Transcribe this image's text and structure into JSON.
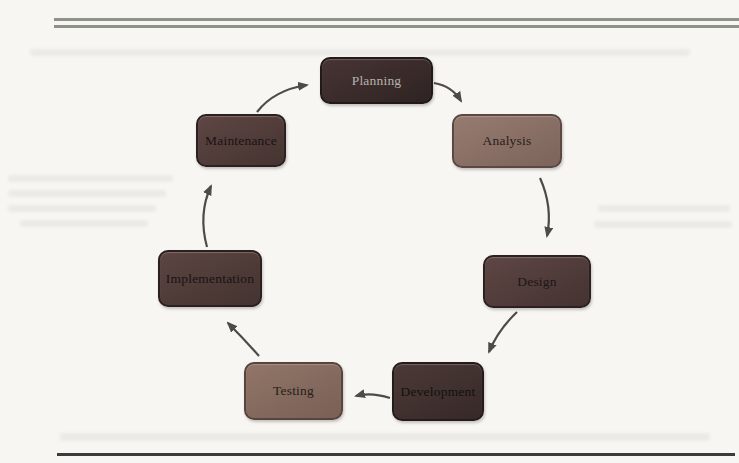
{
  "page": {
    "background_color": "#f7f6f3",
    "top_rule_color": "#8f9289",
    "bottom_rule_color": "#3b3b39"
  },
  "diagram": {
    "arrow_color": "#4c4b47",
    "nodes": [
      {
        "id": "planning",
        "label": "Planning",
        "fill_top": "#473433",
        "fill_bottom": "#2e2423",
        "border": "#221a19",
        "text_color": "#b7b1ae"
      },
      {
        "id": "analysis",
        "label": "Analysis",
        "fill_top": "#967b70",
        "fill_bottom": "#7c645a",
        "border": "#5a4841",
        "text_color": "#262019"
      },
      {
        "id": "design",
        "label": "Design",
        "fill_top": "#5e4643",
        "fill_bottom": "#443331",
        "border": "#2c2120",
        "text_color": "#1c1716"
      },
      {
        "id": "development",
        "label": "Development",
        "fill_top": "#4c3937",
        "fill_bottom": "#362928",
        "border": "#241b1a",
        "text_color": "#15100f"
      },
      {
        "id": "testing",
        "label": "Testing",
        "fill_top": "#917568",
        "fill_bottom": "#796055",
        "border": "#58443c",
        "text_color": "#262019"
      },
      {
        "id": "implementation",
        "label": "Implementation",
        "fill_top": "#5b4542",
        "fill_bottom": "#443330",
        "border": "#2b201f",
        "text_color": "#181312"
      },
      {
        "id": "maintenance",
        "label": "Maintenance",
        "fill_top": "#5e4643",
        "fill_bottom": "#453431",
        "border": "#2c2120",
        "text_color": "#181312"
      }
    ],
    "flow": [
      "Planning",
      "Analysis",
      "Design",
      "Development",
      "Testing",
      "Implementation",
      "Maintenance",
      "Planning"
    ]
  }
}
